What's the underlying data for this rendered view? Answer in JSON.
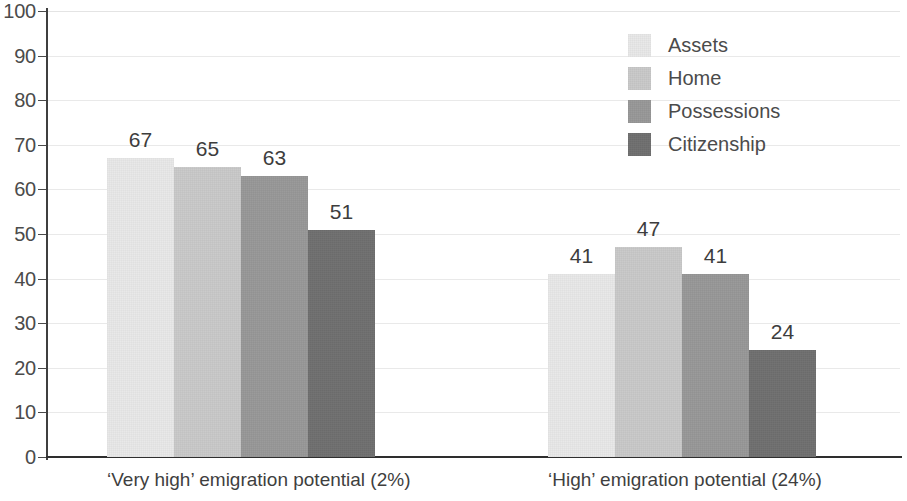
{
  "chart_data": {
    "type": "bar",
    "title": "",
    "subtitle": "",
    "xlabel": "",
    "ylabel": "",
    "ylim": [
      0,
      100
    ],
    "ytick_step": 10,
    "yticks": [
      100,
      90,
      80,
      70,
      60,
      50,
      40,
      30,
      20,
      10,
      0
    ],
    "grid": true,
    "legend_position": "top-right",
    "categories": [
      "‘Very high’ emigration potential (2%)",
      "‘High’ emigration potential (24%)"
    ],
    "series": [
      {
        "name": "Assets",
        "values": [
          67,
          41
        ],
        "color": "#e8e8e8"
      },
      {
        "name": "Home",
        "values": [
          65,
          47
        ],
        "color": "#c9c9c9"
      },
      {
        "name": "Possessions",
        "values": [
          63,
          41
        ],
        "color": "#989898"
      },
      {
        "name": "Citizenship",
        "values": [
          51,
          24
        ],
        "color": "#6f6f6f"
      }
    ]
  },
  "legend": {
    "items": [
      {
        "label": "Assets"
      },
      {
        "label": "Home"
      },
      {
        "label": "Possessions"
      },
      {
        "label": "Citizenship"
      }
    ]
  },
  "axis": {
    "y_labels": [
      "100",
      "90",
      "80",
      "70",
      "60",
      "50",
      "40",
      "30",
      "20",
      "10",
      "0"
    ]
  },
  "colors": {
    "series_1": "#e8e8e8",
    "series_2": "#c9c9c9",
    "series_3": "#989898",
    "series_4": "#6f6f6f",
    "axis": "#2e2e2e",
    "gridline": "#e9e9e9",
    "text": "#4b4b4b"
  }
}
